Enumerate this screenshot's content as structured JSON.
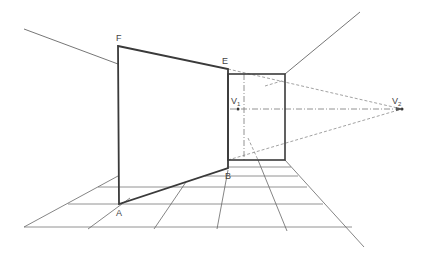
{
  "diagram": {
    "colors": {
      "heavy": "#3a3a3a",
      "thin": "#666666",
      "dashed": "#8a8a8a",
      "background": "#ffffff"
    },
    "labels": {
      "F": {
        "text": "F",
        "x": 116,
        "y": 41
      },
      "E": {
        "text": "E",
        "x": 222,
        "y": 64
      },
      "A": {
        "text": "A",
        "x": 116,
        "y": 216
      },
      "B": {
        "text": "B",
        "x": 225,
        "y": 179
      },
      "V1": {
        "text": "V",
        "sub": "1",
        "x": 231,
        "y": 104
      },
      "V2": {
        "text": "V",
        "sub": "2",
        "x": 392,
        "y": 104
      }
    },
    "points": {
      "F": [
        118,
        46
      ],
      "E": [
        228,
        69
      ],
      "A": [
        119,
        204
      ],
      "B": [
        228,
        168
      ],
      "V1": [
        238,
        109
      ],
      "V2": [
        402,
        109
      ]
    }
  }
}
